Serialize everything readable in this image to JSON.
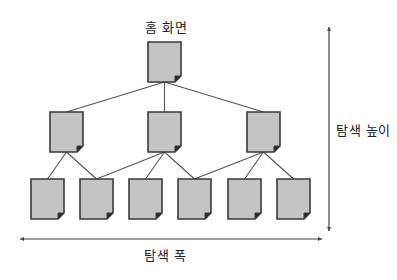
{
  "diagram": {
    "title": "홈 화면",
    "height_label": "탐색 높이",
    "width_label": "탐색 폭",
    "colors": {
      "page_fill": "#c4c4c4",
      "page_stroke": "#3a3a3a",
      "edge": "#555555",
      "arrow": "#444444",
      "text": "#222222"
    },
    "page_size": {
      "w": 33,
      "h": 40
    },
    "nodes": [
      {
        "id": "root",
        "level": 0,
        "x": 148,
        "y": 42
      },
      {
        "id": "l1-a",
        "level": 1,
        "x": 50,
        "y": 112
      },
      {
        "id": "l1-b",
        "level": 1,
        "x": 148,
        "y": 112
      },
      {
        "id": "l1-c",
        "level": 1,
        "x": 247,
        "y": 112
      },
      {
        "id": "l2-a",
        "level": 2,
        "x": 31,
        "y": 179
      },
      {
        "id": "l2-b",
        "level": 2,
        "x": 80,
        "y": 179
      },
      {
        "id": "l2-c",
        "level": 2,
        "x": 129,
        "y": 179
      },
      {
        "id": "l2-d",
        "level": 2,
        "x": 178,
        "y": 179
      },
      {
        "id": "l2-e",
        "level": 2,
        "x": 228,
        "y": 179
      },
      {
        "id": "l2-f",
        "level": 2,
        "x": 277,
        "y": 179
      }
    ],
    "edges": [
      [
        "root",
        "l1-a"
      ],
      [
        "root",
        "l1-b"
      ],
      [
        "root",
        "l1-c"
      ],
      [
        "l1-a",
        "l2-a"
      ],
      [
        "l1-a",
        "l2-b"
      ],
      [
        "l1-b",
        "l2-b"
      ],
      [
        "l1-b",
        "l2-c"
      ],
      [
        "l1-b",
        "l2-d"
      ],
      [
        "l1-c",
        "l2-d"
      ],
      [
        "l1-c",
        "l2-e"
      ],
      [
        "l1-c",
        "l2-f"
      ]
    ],
    "height_arrow": {
      "x": 329,
      "y1": 27,
      "y2": 231
    },
    "width_arrow": {
      "y": 239,
      "x1": 20,
      "x2": 322
    }
  }
}
